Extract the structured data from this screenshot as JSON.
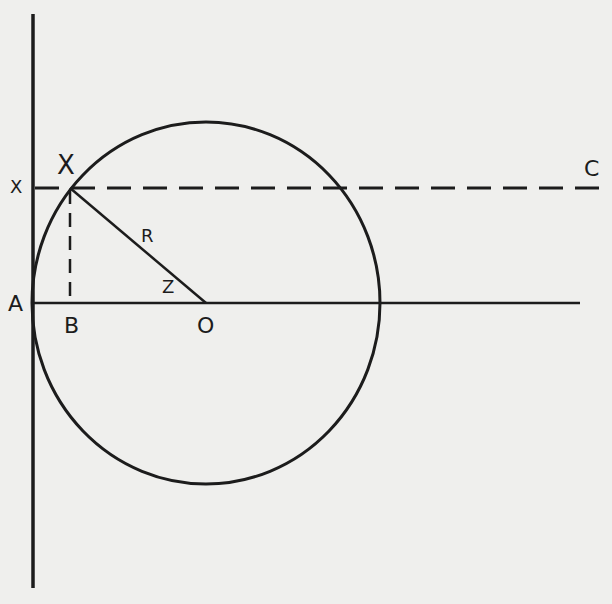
{
  "diagram": {
    "type": "geometry",
    "background": "#efefed",
    "ink": "#1c1c1c",
    "labels": {
      "X_point": "X",
      "X_axis": "X",
      "C": "C",
      "R": "R",
      "z": "Z",
      "A": "A",
      "B": "B",
      "O": "O"
    },
    "elements": {
      "vertical_line": {
        "x": 33,
        "y1": 14,
        "y2": 588
      },
      "horizontal_line": {
        "x1": 33,
        "x2": 580,
        "y": 303
      },
      "dashed_line_XC": {
        "x1": 33,
        "x2": 605,
        "y": 188
      },
      "dashed_line_XB": {
        "x": 70,
        "y1": 188,
        "y2": 303
      },
      "radius_line_XO": {
        "x1": 70,
        "y1": 188,
        "x2": 206,
        "y2": 303
      },
      "circle": {
        "cx": 206,
        "cy": 303,
        "rx": 174,
        "ry": 181
      }
    }
  }
}
